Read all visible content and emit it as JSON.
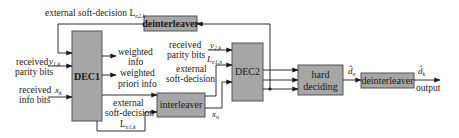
{
  "diagram": {
    "type": "turbo-decoder-block-diagram",
    "colors": {
      "block_fill": "#a6a6a6",
      "block_stroke": "#555555",
      "line": "#1a1a1a",
      "background": "#ffffff"
    },
    "blocks": {
      "dec1": "DEC1",
      "dec2": "DEC2",
      "interleaver": "interleaver",
      "deinterleaver_top": "deinterleaver",
      "hard_deciding_line1": "hard",
      "hard_deciding_line2": "deciding",
      "deinterleaver_out": "deinterleaver"
    },
    "labels": {
      "feedback_top": "external soft-decision L",
      "feedback_top_sub": "e2,k",
      "received_parity_1_line1": "received",
      "received_parity_1_line2": "parity bits",
      "y1k": "y",
      "y1k_sub": "1,k",
      "received_info_line1": "received",
      "received_info_line2": "info bits",
      "xk": "x",
      "xk_sub": "k",
      "weighted_info_line1": "weighted",
      "weighted_info_line2": "info",
      "weighted_priori_line1": "weighted",
      "weighted_priori_line2": "priori info",
      "ext_soft_1_line1": "external",
      "ext_soft_1_line2": "soft-decision",
      "le1k": "L",
      "le1k_sub": "e1,k",
      "received_parity_2_line1": "received",
      "received_parity_2_line2": "parity bits",
      "y2k": "y",
      "y2k_sub": "2,k",
      "ext_soft_2_line1": "external",
      "ext_soft_2_line2": "soft-decision",
      "le1n": "L",
      "le1n_sub": "e1,n",
      "xn": "x",
      "xn_sub": "n",
      "dn": "d̂",
      "dn_sub": "n",
      "dk": "d̂",
      "dk_sub": "k",
      "output": "output"
    }
  }
}
